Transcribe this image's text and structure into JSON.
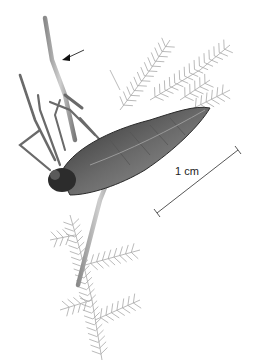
{
  "figure": {
    "annotations": {
      "arrow_target": "tip of foreleg segment",
      "scale_bar_label": "1 cm"
    },
    "colors": {
      "background": "#ffffff",
      "insect_dark": "#3a3a3a",
      "insect_mid": "#7a7a7a",
      "insect_light": "#b5b5b5",
      "plant": "#a8a8a8",
      "scale_bar": "#444444"
    }
  }
}
